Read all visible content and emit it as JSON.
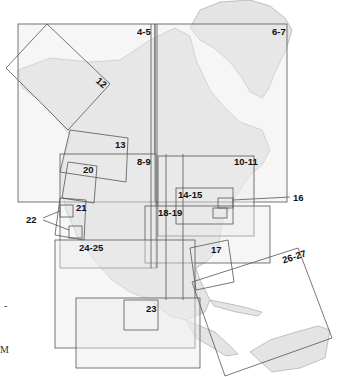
{
  "map": {
    "title": "Index map of North America regional map pages",
    "colors": {
      "land": "#e6e6e6",
      "frame_fill": "#efefef",
      "lines": "#555555",
      "coast": "#9a9a9a",
      "background": "#ffffff"
    },
    "page_labels": [
      {
        "id": "4-5",
        "text": "4-5"
      },
      {
        "id": "6-7",
        "text": "6-7"
      },
      {
        "id": "12",
        "text": "12"
      },
      {
        "id": "13",
        "text": "13"
      },
      {
        "id": "8-9",
        "text": "8-9"
      },
      {
        "id": "10-11",
        "text": "10-11"
      },
      {
        "id": "20",
        "text": "20"
      },
      {
        "id": "14-15",
        "text": "14-15"
      },
      {
        "id": "16",
        "text": "16"
      },
      {
        "id": "21",
        "text": "21"
      },
      {
        "id": "22",
        "text": "22"
      },
      {
        "id": "18-19",
        "text": "18-19"
      },
      {
        "id": "24-25",
        "text": "24-25"
      },
      {
        "id": "17",
        "text": "17"
      },
      {
        "id": "26-27",
        "text": "26-27"
      },
      {
        "id": "23",
        "text": "23"
      }
    ],
    "edge_marks": {
      "dash": "-",
      "letter": "M"
    }
  }
}
